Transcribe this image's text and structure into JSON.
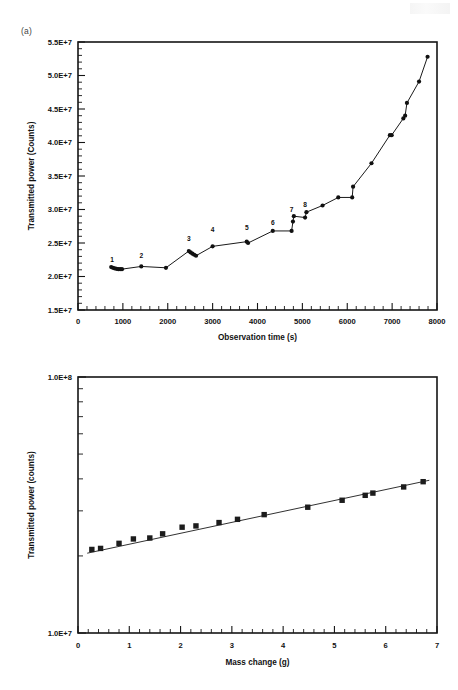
{
  "figure": {
    "panels": [
      {
        "tag": "(a)",
        "xlabel": "Observation time (s)",
        "ylabel": "Transmitted power (Counts)"
      },
      {
        "tag": "(b)",
        "xlabel": "Mass change (g)",
        "ylabel": "Transmitted power (counts)"
      }
    ]
  },
  "chart_data": [
    {
      "type": "line",
      "title": "",
      "subtitle": "",
      "panel": "(a)",
      "xlabel": "Observation time (s)",
      "ylabel": "Transmitted power (Counts)",
      "xlim": [
        0,
        8000
      ],
      "ylim": [
        15000000,
        55000000
      ],
      "xticks": [
        0,
        1000,
        2000,
        3000,
        4000,
        5000,
        6000,
        7000,
        8000
      ],
      "xticklabels": [
        "0",
        "1000",
        "2000",
        "3000",
        "4000",
        "5000",
        "6000",
        "7000",
        "8000"
      ],
      "yticks": [
        15000000,
        20000000,
        25000000,
        30000000,
        35000000,
        40000000,
        45000000,
        50000000,
        55000000
      ],
      "yticklabels": [
        "1.5E+7",
        "2.0E+7",
        "2.5E+7",
        "3.0E+7",
        "3.5E+7",
        "4.0E+7",
        "4.5E+7",
        "5.0E+7",
        "5.5E+7"
      ],
      "yscale": "linear",
      "grid": false,
      "legend": "none",
      "marker": "circle",
      "x": [
        740,
        780,
        820,
        860,
        900,
        940,
        980,
        1410,
        1960,
        2470,
        2510,
        2550,
        2590,
        2630,
        3000,
        3760,
        3790,
        4340,
        4760,
        4790,
        4810,
        5060,
        5090,
        5450,
        5800,
        6110,
        6130,
        6540,
        6950,
        6990,
        7250,
        7290,
        7330,
        7600,
        7790
      ],
      "y": [
        21400000,
        21300000,
        21200000,
        21150000,
        21100000,
        21100000,
        21100000,
        21500000,
        21300000,
        23800000,
        23600000,
        23400000,
        23250000,
        23100000,
        24500000,
        25200000,
        25000000,
        26800000,
        26800000,
        28200000,
        29000000,
        28800000,
        29600000,
        30600000,
        31800000,
        31800000,
        33400000,
        36900000,
        41100000,
        41100000,
        43600000,
        44000000,
        45900000,
        49100000,
        52800000
      ],
      "annotations": [
        {
          "label": "1",
          "x": 760,
          "y": 22100000
        },
        {
          "label": "2",
          "x": 1410,
          "y": 22700000
        },
        {
          "label": "3",
          "x": 2470,
          "y": 25300000
        },
        {
          "label": "4",
          "x": 3000,
          "y": 26600000
        },
        {
          "label": "5",
          "x": 3760,
          "y": 26900000
        },
        {
          "label": "6",
          "x": 4340,
          "y": 27700000
        },
        {
          "label": "7",
          "x": 4760,
          "y": 29700000
        },
        {
          "label": "8",
          "x": 5060,
          "y": 30400000
        }
      ]
    },
    {
      "type": "scatter",
      "title": "",
      "subtitle": "",
      "panel": "(b)",
      "xlabel": "Mass change (g)",
      "ylabel": "Transmitted power (counts)",
      "xlim": [
        0,
        7
      ],
      "ylim": [
        10000000,
        100000000
      ],
      "xticks": [
        0,
        1,
        2,
        3,
        4,
        5,
        6,
        7
      ],
      "xticklabels": [
        "0",
        "1",
        "2",
        "3",
        "4",
        "5",
        "6",
        "7"
      ],
      "yticks": [
        10000000,
        100000000
      ],
      "yticklabels": [
        "1.0E+7",
        "1.0E+8"
      ],
      "yscale": "log",
      "grid": false,
      "legend": "none",
      "marker": "square",
      "x": [
        0.27,
        0.44,
        0.8,
        1.08,
        1.4,
        1.65,
        2.03,
        2.3,
        2.75,
        3.11,
        3.63,
        4.48,
        5.15,
        5.6,
        5.75,
        6.35,
        6.73
      ],
      "y": [
        21200000,
        21400000,
        22400000,
        23300000,
        23500000,
        24400000,
        25900000,
        26200000,
        27000000,
        27800000,
        29000000,
        31000000,
        33000000,
        34500000,
        35200000,
        37200000,
        39000000
      ],
      "fit_line": {
        "x": [
          0.18,
          6.85
        ],
        "y": [
          20500000,
          39500000
        ]
      }
    }
  ]
}
